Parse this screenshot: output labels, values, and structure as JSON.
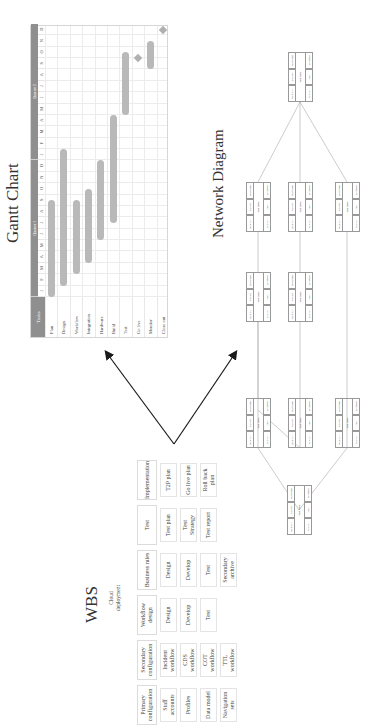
{
  "wbs": {
    "title": "WBS",
    "root": "Cloud deployment",
    "columns": [
      {
        "header": "Primary configuration",
        "items": [
          "Staff accounts",
          "Profiles",
          "Data model",
          "Navigation sets"
        ]
      },
      {
        "header": "Secondary configuration",
        "items": [
          "Incident workflow",
          "CDS workflow",
          "COT workflow",
          "TTL workflow"
        ]
      },
      {
        "header": "Workflow design",
        "items": [
          "Design",
          "Develop",
          "Test"
        ]
      },
      {
        "header": "Business rules",
        "items": [
          "Design",
          "Develop",
          "Test",
          "Secondary archive"
        ]
      },
      {
        "header": "Test",
        "items": [
          "Test plan",
          "Test Strategy",
          "Test report"
        ]
      },
      {
        "header": "Implementation",
        "items": [
          "T2P plan",
          "Go live plan",
          "Roll back plan"
        ]
      }
    ]
  },
  "gantt": {
    "title": "Gantt Chart",
    "task_header": "Tasks",
    "quarters": [
      "Quarter 1",
      "Quarter 2"
    ],
    "months": [
      "J",
      "F",
      "M",
      "A",
      "M",
      "J",
      "J",
      "A",
      "S",
      "O",
      "N",
      "D",
      "J",
      "F",
      "M",
      "A",
      "M",
      "J",
      "J",
      "A",
      "S",
      "O",
      "N",
      "D"
    ],
    "tasks": [
      "Plan",
      "Design",
      "Workflow",
      "Integration",
      "Hardware",
      "Build",
      "Test",
      "Go live",
      "Monitor",
      "Close out"
    ]
  },
  "chart_data": {
    "type": "gantt",
    "title": "Gantt Chart",
    "categories": [
      "Plan",
      "Design",
      "Workflow",
      "Integration",
      "Hardware",
      "Build",
      "Test",
      "Go live",
      "Monitor",
      "Close out"
    ],
    "x_ticks": [
      "J",
      "F",
      "M",
      "A",
      "M",
      "J",
      "J",
      "A",
      "S",
      "O",
      "N",
      "D",
      "J",
      "F",
      "M",
      "A",
      "M",
      "J",
      "J",
      "A",
      "S",
      "O",
      "N",
      "D"
    ],
    "x_groups": [
      "Quarter 1",
      "Quarter 2"
    ],
    "bars": [
      {
        "task": "Plan",
        "start": 0,
        "end": 8.5
      },
      {
        "task": "Design",
        "start": 1,
        "end": 13
      },
      {
        "task": "Workflow",
        "start": 2,
        "end": 8.5
      },
      {
        "task": "Integration",
        "start": 3,
        "end": 9.5
      },
      {
        "task": "Hardware",
        "start": 5,
        "end": 12
      },
      {
        "task": "Build",
        "start": 6.5,
        "end": 16
      },
      {
        "task": "Test",
        "start": 16,
        "end": 21.5
      },
      {
        "task": "Go live",
        "milestone": 21
      },
      {
        "task": "Monitor",
        "start": 20,
        "end": 22.5
      },
      {
        "task": "Close out",
        "milestone": 23.5
      }
    ]
  },
  "network": {
    "title": "Network Diagram",
    "node_fields": {
      "top": [
        "Early Start",
        "Duration",
        "Early Finish"
      ],
      "middle": "Task Name",
      "bottom": [
        "Late Start",
        "Slack",
        "Late Finish"
      ]
    },
    "node_count": 9
  },
  "colors": {
    "header_gray": "#8f8f8f",
    "bar_gray": "#b9b9b9",
    "arrow": "#1a1a1a"
  }
}
